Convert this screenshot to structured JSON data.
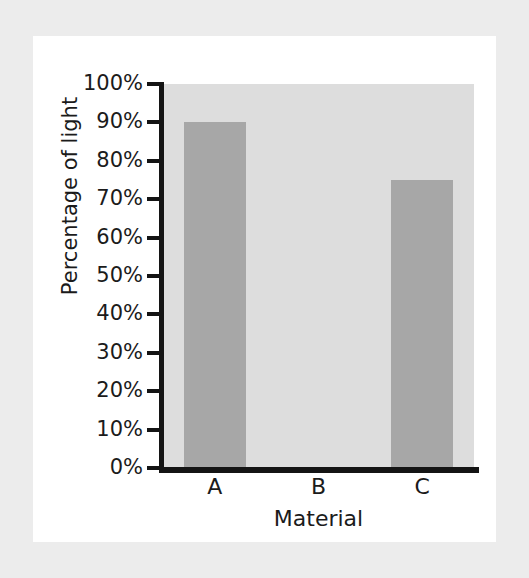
{
  "chart_data": {
    "type": "bar",
    "title": "",
    "subtitle": "",
    "categories": [
      "A",
      "B",
      "C"
    ],
    "values": [
      90,
      0,
      75
    ],
    "series": [
      {
        "name": "Percentage of light",
        "values": [
          90,
          0,
          75
        ]
      }
    ],
    "xlabel": "Material",
    "ylabel": "Percentage of light",
    "ylim": [
      0,
      100
    ],
    "ytick_values": [
      0,
      10,
      20,
      30,
      40,
      50,
      60,
      70,
      80,
      90,
      100
    ],
    "ytick_labels": [
      "0%",
      "10%",
      "20%",
      "30%",
      "40%",
      "50%",
      "60%",
      "70%",
      "80%",
      "90%",
      "100%"
    ],
    "grid": false,
    "legend": "none",
    "bar_color": "#a7a7a7",
    "plot_background": "#dddddd",
    "axis_color": "#141414",
    "text_color": "#1b1b1b",
    "card_background": "#ffffff",
    "page_background": "#ececec"
  },
  "axis": {
    "y_title": "Percentage of light",
    "x_title": "Material"
  }
}
